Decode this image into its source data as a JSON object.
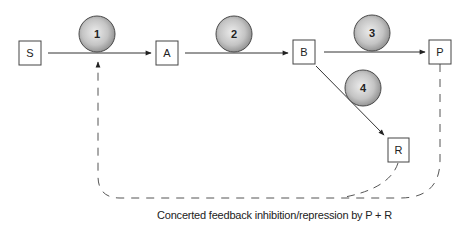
{
  "diagram": {
    "type": "metabolic-pathway-feedback",
    "nodes": [
      {
        "id": "S",
        "label": "S"
      },
      {
        "id": "A",
        "label": "A"
      },
      {
        "id": "B",
        "label": "B"
      },
      {
        "id": "P",
        "label": "P"
      },
      {
        "id": "R",
        "label": "R"
      }
    ],
    "enzymes": [
      {
        "id": "1",
        "label": "1",
        "edge": "S->A"
      },
      {
        "id": "2",
        "label": "2",
        "edge": "A->B"
      },
      {
        "id": "3",
        "label": "3",
        "edge": "B->P"
      },
      {
        "id": "4",
        "label": "4",
        "edge": "B->R"
      }
    ],
    "edges": [
      {
        "from": "S",
        "to": "A",
        "style": "solid"
      },
      {
        "from": "A",
        "to": "B",
        "style": "solid"
      },
      {
        "from": "B",
        "to": "P",
        "style": "solid"
      },
      {
        "from": "B",
        "to": "R",
        "style": "solid"
      },
      {
        "from": "P",
        "to": "enzyme-1",
        "style": "dashed"
      },
      {
        "from": "R",
        "to": "enzyme-1",
        "style": "dashed"
      }
    ],
    "caption": "Concerted feedback inhibition/repression by P + R",
    "colors": {
      "line": "#333333",
      "dashed": "#555555",
      "circle_light": "#e8e8e8",
      "circle_dark": "#8e8e8e",
      "circle_stroke": "#4a4a4a"
    }
  }
}
